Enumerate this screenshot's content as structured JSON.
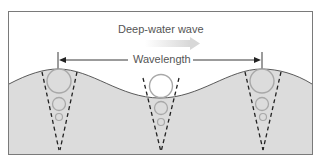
{
  "title": "Deep-water wave",
  "wavelength_label": "Wavelength",
  "colors": {
    "water": "#dcdcdc",
    "frame": "#7a7a7a",
    "orbit": "#a8a8a8",
    "text": "#555555",
    "arrow": "#222222",
    "direction_arrow": "#e2e2e2"
  },
  "elements": {
    "direction_arrow": "gradient-arrow pointing right",
    "orbit_columns": [
      {
        "position": "left crest",
        "orbits": 3
      },
      {
        "position": "trough",
        "orbits": 3
      },
      {
        "position": "right crest",
        "orbits": 3
      }
    ]
  }
}
